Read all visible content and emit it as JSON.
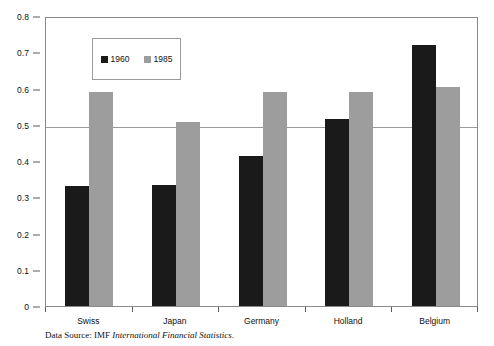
{
  "chart_data": {
    "type": "bar",
    "title": "",
    "xlabel": "",
    "ylabel": "",
    "categories": [
      "Swiss",
      "Japan",
      "Germany",
      "Holland",
      "Belgium"
    ],
    "series": [
      {
        "name": "1960",
        "color": "#1a1a1a",
        "values": [
          0.33,
          0.335,
          0.415,
          0.515,
          0.72
        ]
      },
      {
        "name": "1985",
        "color": "#9d9d9d",
        "values": [
          0.59,
          0.507,
          0.59,
          0.59,
          0.605
        ]
      }
    ],
    "ylim": [
      0,
      0.8
    ],
    "ytick_values": [
      0,
      0.1,
      0.2,
      0.3,
      0.4,
      0.5,
      0.6,
      0.7,
      0.8
    ],
    "ytick_labels": [
      "0",
      "0.1",
      "0.2",
      "0.3",
      "0.4",
      "0.5",
      "0.6",
      "0.7",
      "0.8"
    ],
    "gridlines_at": [
      0.5,
      0.8
    ],
    "grid": true,
    "legend": {
      "position": "top-left-inset",
      "entries": [
        "1960",
        "1985"
      ]
    }
  },
  "caption": {
    "prefix": "Data Source: IMF ",
    "source_title": "International Financial Statistics",
    "suffix": "."
  }
}
